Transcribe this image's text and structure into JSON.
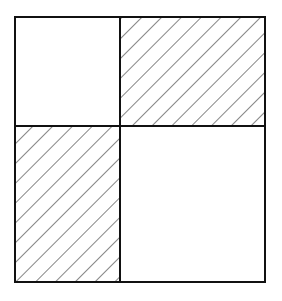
{
  "diagram": {
    "type": "grid-2x2",
    "colors": {
      "stroke": "#111111",
      "hatch": "#333333",
      "background": "#ffffff"
    },
    "cells": [
      {
        "position": "top-left",
        "hatched": false
      },
      {
        "position": "top-right",
        "hatched": true
      },
      {
        "position": "bottom-left",
        "hatched": true
      },
      {
        "position": "bottom-right",
        "hatched": false
      }
    ]
  }
}
